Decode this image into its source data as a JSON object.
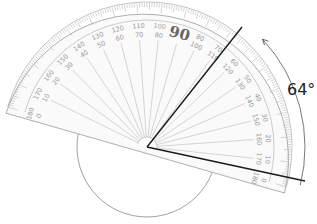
{
  "diagram": {
    "type": "protractor-angle-measurement",
    "angle_label": "64°",
    "angle_value": 64,
    "center_label": "90",
    "outer_scale": [
      "0",
      "10",
      "20",
      "30",
      "40",
      "50",
      "60",
      "70",
      "80",
      "90",
      "100",
      "110",
      "120",
      "130",
      "140",
      "150",
      "160",
      "170",
      "180"
    ],
    "inner_scale": [
      "180",
      "170",
      "160",
      "150",
      "140",
      "130",
      "120",
      "110",
      "100",
      "90",
      "80",
      "70",
      "60",
      "50",
      "40",
      "30",
      "20",
      "10",
      "0"
    ],
    "colors": {
      "protractor_line": "#9a9a9a",
      "ray": "#1a1a1a",
      "text": "#222222"
    }
  }
}
